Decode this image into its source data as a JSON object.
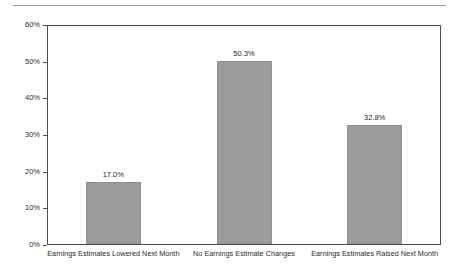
{
  "chart_data": {
    "type": "bar",
    "title": "",
    "subtitle": "",
    "xlabel": "",
    "ylabel": "",
    "categories": [
      "Earnings Estimates Lowered Next Month",
      "No Earnings Estimate Changes",
      "Earnings Estimates Raised Next Month"
    ],
    "values": [
      17.0,
      50.3,
      32.8
    ],
    "data_labels": [
      "17.0%",
      "50.3%",
      "32.8%"
    ],
    "ylim": [
      0,
      60
    ],
    "ytick_values": [
      0,
      10,
      20,
      30,
      40,
      50,
      60
    ],
    "ytick_labels": [
      "0%",
      "10%",
      "20%",
      "30%",
      "40%",
      "50%",
      "60%"
    ],
    "grid": false,
    "legend": false,
    "legend_position": "none",
    "bar_color": "#9c9c9c",
    "axis_color": "#4d4d4d",
    "rule_color": "#9a9a9a",
    "text_color": "#2b2b2b"
  }
}
